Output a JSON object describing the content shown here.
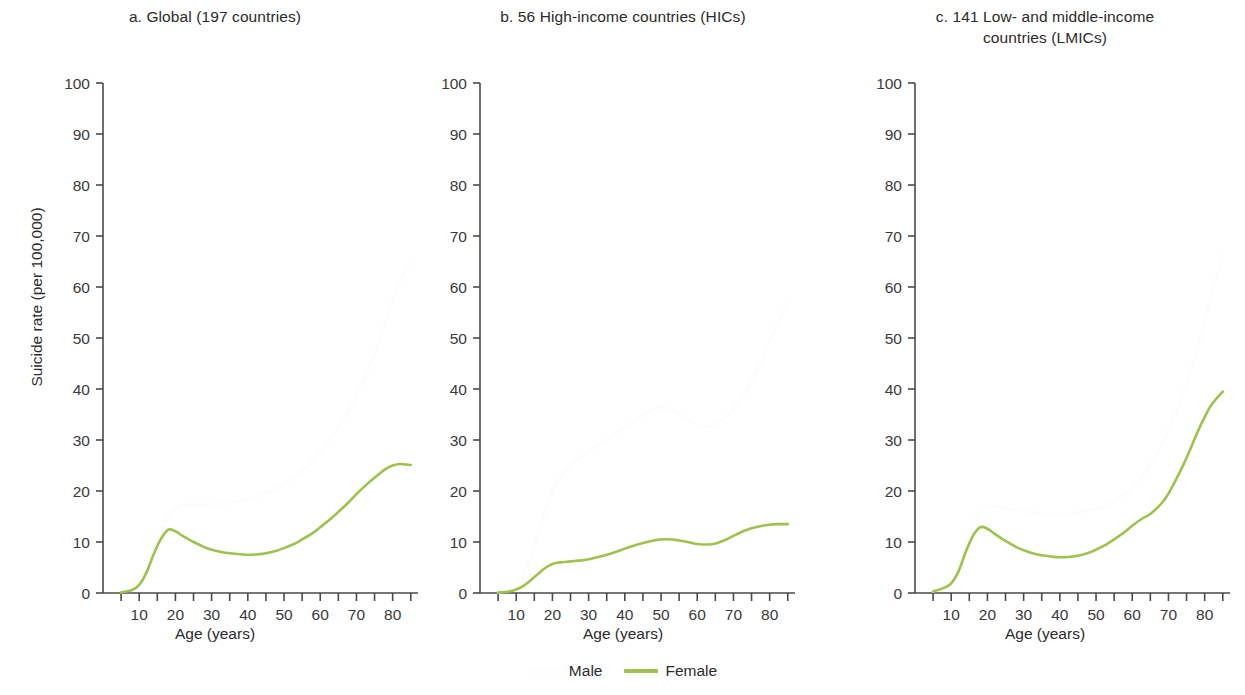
{
  "figure": {
    "y_axis_title": "Suicide rate (per 100,000)",
    "x_axis_title": "Age (years)"
  },
  "legend": {
    "position": "bottom-center",
    "entries": [
      {
        "label": "Male",
        "color": "#fcfcfc"
      },
      {
        "label": "Female",
        "color": "#9dc24e"
      }
    ]
  },
  "panels": [
    {
      "id": "a",
      "title": "a. Global (197 countries)",
      "xlabel": "Age (years)"
    },
    {
      "id": "b",
      "title": "b. 56 High-income countries (HICs)",
      "xlabel": "Age (years)"
    },
    {
      "id": "c",
      "title": "c. 141 Low- and middle-income\ncountries (LMICs)",
      "xlabel": "Age (years)"
    }
  ],
  "chart_data": [
    {
      "type": "line",
      "panel": "a",
      "title": "a. Global (197 countries)",
      "xlabel": "Age (years)",
      "ylabel": "Suicide rate (per 100,000)",
      "xlim": [
        0,
        87
      ],
      "ylim": [
        0,
        100
      ],
      "xticks": [
        10,
        20,
        30,
        40,
        50,
        60,
        70,
        80
      ],
      "xminorticks": [
        5,
        15,
        25,
        35,
        45,
        55,
        65,
        75,
        85
      ],
      "yticks": [
        0,
        10,
        20,
        30,
        40,
        50,
        60,
        70,
        80,
        90,
        100
      ],
      "grid": false,
      "x": [
        5,
        8,
        10,
        12,
        14,
        16,
        18,
        20,
        22,
        25,
        28,
        30,
        33,
        35,
        38,
        40,
        43,
        45,
        48,
        50,
        53,
        55,
        58,
        60,
        63,
        65,
        68,
        70,
        73,
        75,
        78,
        80,
        82,
        85
      ],
      "series": [
        {
          "name": "Male",
          "color": "#fcfcfc",
          "values": [
            0.2,
            1.0,
            2.5,
            5.0,
            8.5,
            12.0,
            15.0,
            16.6,
            17.2,
            17.4,
            17.4,
            17.4,
            17.5,
            17.7,
            18.0,
            18.4,
            19.0,
            19.6,
            20.6,
            21.4,
            22.8,
            24.0,
            26.0,
            27.6,
            30.3,
            32.4,
            36.0,
            39.0,
            43.5,
            47.0,
            53.0,
            57.5,
            61.0,
            65.0
          ]
        },
        {
          "name": "Female",
          "color": "#9dc24e",
          "values": [
            0.1,
            0.6,
            1.6,
            4.0,
            7.6,
            10.6,
            12.4,
            12.1,
            11.2,
            10.0,
            9.0,
            8.5,
            8.0,
            7.8,
            7.6,
            7.5,
            7.6,
            7.8,
            8.3,
            8.8,
            9.7,
            10.5,
            11.8,
            12.9,
            14.6,
            15.9,
            17.9,
            19.4,
            21.4,
            22.6,
            24.3,
            25.0,
            25.3,
            25.1
          ]
        }
      ]
    },
    {
      "type": "line",
      "panel": "b",
      "title": "b. 56 High-income countries (HICs)",
      "xlabel": "Age (years)",
      "ylabel": "Suicide rate (per 100,000)",
      "xlim": [
        0,
        87
      ],
      "ylim": [
        0,
        100
      ],
      "xticks": [
        10,
        20,
        30,
        40,
        50,
        60,
        70,
        80
      ],
      "xminorticks": [
        5,
        15,
        25,
        35,
        45,
        55,
        65,
        75,
        85
      ],
      "yticks": [
        0,
        10,
        20,
        30,
        40,
        50,
        60,
        70,
        80,
        90,
        100
      ],
      "grid": false,
      "x": [
        5,
        8,
        10,
        12,
        14,
        16,
        18,
        20,
        22,
        25,
        28,
        30,
        33,
        35,
        38,
        40,
        43,
        45,
        48,
        50,
        53,
        55,
        58,
        60,
        63,
        65,
        68,
        70,
        73,
        75,
        78,
        80,
        82,
        85
      ],
      "series": [
        {
          "name": "Male",
          "color": "#fcfcfc",
          "values": [
            0.1,
            0.5,
            1.5,
            3.5,
            7.0,
            11.5,
            16.0,
            20.0,
            22.5,
            25.0,
            26.8,
            27.8,
            29.2,
            30.2,
            31.6,
            32.6,
            34.0,
            35.0,
            36.0,
            36.4,
            36.0,
            35.2,
            33.8,
            33.0,
            32.6,
            33.0,
            34.6,
            36.2,
            39.0,
            41.5,
            46.0,
            49.5,
            52.5,
            57.0
          ]
        },
        {
          "name": "Female",
          "color": "#9dc24e",
          "values": [
            0.1,
            0.3,
            0.7,
            1.4,
            2.5,
            3.7,
            4.9,
            5.7,
            6.0,
            6.2,
            6.4,
            6.6,
            7.1,
            7.5,
            8.2,
            8.7,
            9.4,
            9.8,
            10.3,
            10.5,
            10.5,
            10.3,
            9.9,
            9.6,
            9.5,
            9.7,
            10.5,
            11.2,
            12.2,
            12.7,
            13.2,
            13.4,
            13.5,
            13.5
          ]
        }
      ]
    },
    {
      "type": "line",
      "panel": "c",
      "title": "c. 141 Low- and middle-income countries (LMICs)",
      "xlabel": "Age (years)",
      "ylabel": "Suicide rate (per 100,000)",
      "xlim": [
        0,
        87
      ],
      "ylim": [
        0,
        100
      ],
      "xticks": [
        10,
        20,
        30,
        40,
        50,
        60,
        70,
        80
      ],
      "xminorticks": [
        5,
        15,
        25,
        35,
        45,
        55,
        65,
        75,
        85
      ],
      "yticks": [
        0,
        10,
        20,
        30,
        40,
        50,
        60,
        70,
        80,
        90,
        100
      ],
      "grid": false,
      "x": [
        5,
        8,
        10,
        12,
        14,
        16,
        18,
        20,
        22,
        25,
        28,
        30,
        33,
        35,
        38,
        40,
        43,
        45,
        48,
        50,
        53,
        55,
        58,
        60,
        63,
        65,
        68,
        70,
        73,
        75,
        78,
        80,
        82,
        85
      ],
      "series": [
        {
          "name": "Male",
          "color": "#fcfcfc",
          "values": [
            0.3,
            1.1,
            2.6,
            5.4,
            9.4,
            13.4,
            16.4,
            17.2,
            17.0,
            16.6,
            16.2,
            16.0,
            15.8,
            15.7,
            15.6,
            15.6,
            15.7,
            15.8,
            16.2,
            16.5,
            17.3,
            18.0,
            19.5,
            20.8,
            23.2,
            25.2,
            29.0,
            32.0,
            37.0,
            41.0,
            48.0,
            53.5,
            58.5,
            66.5
          ]
        },
        {
          "name": "Female",
          "color": "#9dc24e",
          "values": [
            0.3,
            1.0,
            1.9,
            4.2,
            8.0,
            11.2,
            12.9,
            12.6,
            11.6,
            10.2,
            9.0,
            8.4,
            7.7,
            7.4,
            7.1,
            7.0,
            7.1,
            7.3,
            7.9,
            8.5,
            9.6,
            10.5,
            12.0,
            13.2,
            14.7,
            15.5,
            17.5,
            19.5,
            23.5,
            26.5,
            31.5,
            34.5,
            37.0,
            39.5
          ]
        }
      ]
    }
  ]
}
